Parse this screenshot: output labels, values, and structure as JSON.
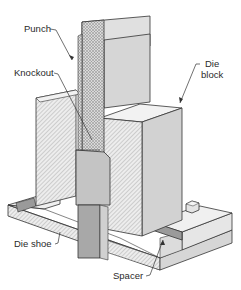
{
  "diagram": {
    "type": "cutaway-isometric",
    "labels": {
      "punch": "Punch",
      "knockout": "Knockout",
      "die_block_line1": "Die",
      "die_block_line2": "block",
      "die_shoe": "Die shoe",
      "spacer": "Spacer"
    },
    "components": [
      {
        "id": "punch",
        "label": "Punch"
      },
      {
        "id": "knockout",
        "label": "Knockout"
      },
      {
        "id": "die-block",
        "label": "Die block"
      },
      {
        "id": "die-shoe",
        "label": "Die shoe"
      },
      {
        "id": "spacer",
        "label": "Spacer"
      },
      {
        "id": "bolt",
        "label": ""
      }
    ],
    "colors": {
      "background": "#ffffff",
      "outline": "#333333",
      "face_light": "#e6e6e6",
      "face_mid": "#d2d2d2",
      "face_dark": "#b9b9b9",
      "spacer": "#9a9a9a",
      "hatch": "#8a8a8a"
    }
  }
}
